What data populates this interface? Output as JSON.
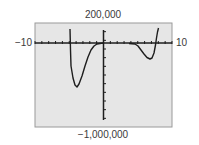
{
  "chart_data": {
    "type": "line",
    "title": "",
    "xlabel": "",
    "ylabel": "",
    "xlim": [
      -10,
      10
    ],
    "ylim": [
      -1000000,
      200000
    ],
    "xscale_ticks": 1,
    "yscale_ticks": 100000,
    "grid": false,
    "window_labels": {
      "xmin": "−10",
      "xmax": "10",
      "ymax": "200,000",
      "ymin": "−1,000,000"
    },
    "series": [
      {
        "name": "f(x)",
        "description": "Graphing-calculator style curve with vertical asymptote near x = -5 and x = 0, local minima near x = -4 and x = 7",
        "points_left_branch": [
          {
            "x": -4.9,
            "y": 130000
          },
          {
            "x": -4.85,
            "y": -300000
          },
          {
            "x": -4.5,
            "y": -600000
          },
          {
            "x": -3.8,
            "y": -620000
          },
          {
            "x": -3.0,
            "y": -450000
          },
          {
            "x": -2.0,
            "y": -120000
          },
          {
            "x": -1.0,
            "y": -20000
          },
          {
            "x": -0.2,
            "y": 0
          }
        ],
        "points_right_branch": [
          {
            "x": 2.0,
            "y": 0
          },
          {
            "x": 3.5,
            "y": -10000
          },
          {
            "x": 5.0,
            "y": -90000
          },
          {
            "x": 6.7,
            "y": -160000
          },
          {
            "x": 7.3,
            "y": -100000
          },
          {
            "x": 7.8,
            "y": 0
          },
          {
            "x": 8.0,
            "y": 130000
          }
        ]
      }
    ]
  },
  "colors": {
    "plot_background": "#e6e6e6",
    "frame": "#9a9a9a",
    "axis": "#1e1e1e",
    "curve": "#1e1e1e",
    "label": "#3a3a3a"
  }
}
